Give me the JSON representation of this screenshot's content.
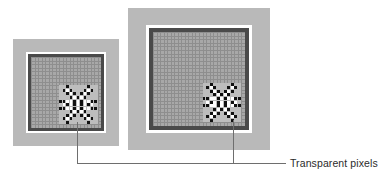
{
  "figure": {
    "type": "diagram",
    "background_color": "#ffffff"
  },
  "annotation": {
    "label": "Transparent pixels",
    "leader_line_color": "#6e6e6e"
  },
  "panels": [
    {
      "id": "small-image",
      "name": "small-magnified-image",
      "mat_color": "#b9b9b9",
      "white_border_color": "#ffffff",
      "frame_color": "#4a4a4a",
      "canvas_color": "#a8a8a8",
      "grid_line_color": "#8e8e8e",
      "grid_columns": 20,
      "grid_rows": 20,
      "zoom_level": "low"
    },
    {
      "id": "large-image",
      "name": "large-magnified-image",
      "mat_color": "#b9b9b9",
      "white_border_color": "#ffffff",
      "frame_color": "#4a4a4a",
      "canvas_color": "#a8a8a8",
      "grid_line_color": "#8e8e8e",
      "grid_columns": 26,
      "grid_rows": 26,
      "zoom_level": "high"
    }
  ],
  "sprite": {
    "name": "transparent-pixel-burst",
    "opaque_color": "#111111",
    "transparent_color": "#ffffff",
    "backdrop_color": "#bdbdbd",
    "cells": [
      "..X.....X..",
      ".XoX...XoX.",
      "..XoX.XoX..",
      "...XoXoX...",
      "XXooXoXooXX",
      ".oXoXoXoXo.",
      "XXooXoXooXX",
      "...XoXoX...",
      "..XoX.XoX..",
      ".XoX...XoX.",
      "..X.....X.."
    ]
  }
}
